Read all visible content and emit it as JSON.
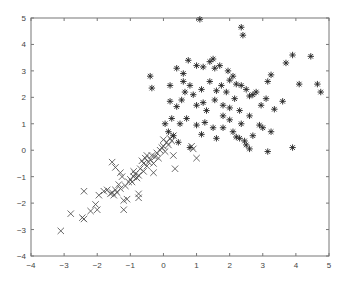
{
  "chart_data": {
    "type": "scatter",
    "title": "",
    "xlabel": "",
    "ylabel": "",
    "xlim": [
      -4,
      5
    ],
    "ylim": [
      -4,
      5
    ],
    "grid": false,
    "legend": null,
    "x_ticks": [
      -4,
      -3,
      -2,
      -1,
      0,
      1,
      2,
      3,
      4,
      5
    ],
    "y_ticks": [
      -4,
      -3,
      -2,
      -1,
      0,
      1,
      2,
      3,
      4,
      5
    ],
    "series": [
      {
        "name": "class-x",
        "marker": "x",
        "points": [
          [
            -3.1,
            -3.05
          ],
          [
            -2.8,
            -2.4
          ],
          [
            -2.45,
            -2.55
          ],
          [
            -2.4,
            -2.6
          ],
          [
            -2.4,
            -1.55
          ],
          [
            -2.2,
            -2.3
          ],
          [
            -2.05,
            -2.05
          ],
          [
            -2.0,
            -2.25
          ],
          [
            -1.95,
            -1.7
          ],
          [
            -1.8,
            -1.55
          ],
          [
            -1.7,
            -1.5
          ],
          [
            -1.6,
            -1.65
          ],
          [
            -1.55,
            -1.6
          ],
          [
            -1.5,
            -1.7
          ],
          [
            -1.45,
            -1.5
          ],
          [
            -1.4,
            -1.6
          ],
          [
            -1.35,
            -1.3
          ],
          [
            -1.3,
            -1.45
          ],
          [
            -1.25,
            -1.0
          ],
          [
            -1.2,
            -1.9
          ],
          [
            -1.2,
            -2.25
          ],
          [
            -1.15,
            -1.35
          ],
          [
            -1.1,
            -1.85
          ],
          [
            -1.05,
            -1.2
          ],
          [
            -1.0,
            -1.1
          ],
          [
            -0.95,
            -1.2
          ],
          [
            -0.9,
            -1.0
          ],
          [
            -0.85,
            -0.9
          ],
          [
            -0.8,
            -1.05
          ],
          [
            -0.75,
            -0.95
          ],
          [
            -0.75,
            -1.65
          ],
          [
            -0.75,
            -1.8
          ],
          [
            -0.7,
            -0.7
          ],
          [
            -0.65,
            -0.4
          ],
          [
            -0.6,
            -0.8
          ],
          [
            -0.6,
            -0.5
          ],
          [
            -0.55,
            -0.3
          ],
          [
            -0.5,
            -0.6
          ],
          [
            -0.45,
            -0.45
          ],
          [
            -0.4,
            -0.35
          ],
          [
            -0.35,
            -0.2
          ],
          [
            -0.3,
            -0.5
          ],
          [
            -0.3,
            -0.85
          ],
          [
            -0.25,
            -0.25
          ],
          [
            -0.2,
            -0.1
          ],
          [
            -0.15,
            -0.3
          ],
          [
            -0.1,
            0.0
          ],
          [
            -0.05,
            0.1
          ],
          [
            0.0,
            0.15
          ],
          [
            0.05,
            -0.05
          ],
          [
            0.1,
            0.3
          ],
          [
            0.15,
            0.2
          ],
          [
            0.2,
            0.45
          ],
          [
            0.25,
            0.35
          ],
          [
            0.3,
            0.55
          ],
          [
            0.35,
            -0.7
          ],
          [
            0.85,
            0.15
          ],
          [
            0.9,
            0.05
          ],
          [
            1.0,
            -0.3
          ],
          [
            -1.55,
            -0.45
          ],
          [
            -1.45,
            -0.65
          ],
          [
            -1.3,
            -0.85
          ],
          [
            -0.9,
            -0.8
          ],
          [
            -0.5,
            -0.2
          ],
          [
            0.0,
            0.4
          ],
          [
            0.3,
            -0.2
          ]
        ]
      },
      {
        "name": "class-star",
        "marker": "*",
        "points": [
          [
            1.1,
            4.95
          ],
          [
            2.35,
            4.65
          ],
          [
            2.4,
            4.35
          ],
          [
            -0.4,
            2.8
          ],
          [
            -0.35,
            2.35
          ],
          [
            0.2,
            2.45
          ],
          [
            0.4,
            3.1
          ],
          [
            0.6,
            2.9
          ],
          [
            0.75,
            3.4
          ],
          [
            1.0,
            3.2
          ],
          [
            1.2,
            3.15
          ],
          [
            1.4,
            3.35
          ],
          [
            1.5,
            3.45
          ],
          [
            1.55,
            3.1
          ],
          [
            1.7,
            3.2
          ],
          [
            1.95,
            3.0
          ],
          [
            0.6,
            2.6
          ],
          [
            0.8,
            2.45
          ],
          [
            1.15,
            2.3
          ],
          [
            1.4,
            2.6
          ],
          [
            1.6,
            2.25
          ],
          [
            1.75,
            2.45
          ],
          [
            2.0,
            2.65
          ],
          [
            2.1,
            2.8
          ],
          [
            2.2,
            2.5
          ],
          [
            2.35,
            2.45
          ],
          [
            2.5,
            2.3
          ],
          [
            0.2,
            1.85
          ],
          [
            0.4,
            1.65
          ],
          [
            0.55,
            1.9
          ],
          [
            0.9,
            2.1
          ],
          [
            1.0,
            1.7
          ],
          [
            1.2,
            1.8
          ],
          [
            1.3,
            1.5
          ],
          [
            1.55,
            1.9
          ],
          [
            1.8,
            1.7
          ],
          [
            2.0,
            1.6
          ],
          [
            2.15,
            1.95
          ],
          [
            2.3,
            1.5
          ],
          [
            2.6,
            2.05
          ],
          [
            0.25,
            1.2
          ],
          [
            0.5,
            1.0
          ],
          [
            0.7,
            1.2
          ],
          [
            1.0,
            0.95
          ],
          [
            1.25,
            1.05
          ],
          [
            1.5,
            0.85
          ],
          [
            1.8,
            0.85
          ],
          [
            2.1,
            0.7
          ],
          [
            2.2,
            0.5
          ],
          [
            2.3,
            0.45
          ],
          [
            2.45,
            0.35
          ],
          [
            2.5,
            0.2
          ],
          [
            2.6,
            0.05
          ],
          [
            2.7,
            0.55
          ],
          [
            2.9,
            0.95
          ],
          [
            3.0,
            0.85
          ],
          [
            3.25,
            2.85
          ],
          [
            3.6,
            1.85
          ],
          [
            3.35,
            1.55
          ],
          [
            3.25,
            0.7
          ],
          [
            3.15,
            -0.05
          ],
          [
            3.9,
            0.1
          ],
          [
            3.7,
            3.3
          ],
          [
            3.9,
            3.6
          ],
          [
            4.1,
            2.5
          ],
          [
            4.45,
            3.55
          ],
          [
            4.65,
            2.5
          ],
          [
            4.75,
            2.2
          ],
          [
            3.15,
            2.6
          ],
          [
            3.1,
            1.95
          ],
          [
            2.7,
            2.1
          ],
          [
            2.8,
            2.2
          ],
          [
            0.3,
            0.55
          ],
          [
            0.45,
            0.3
          ],
          [
            0.8,
            0.1
          ],
          [
            0.05,
            1.0
          ],
          [
            0.15,
            0.7
          ],
          [
            1.15,
            0.6
          ],
          [
            1.6,
            0.45
          ],
          [
            2.0,
            1.15
          ],
          [
            2.35,
            1.0
          ],
          [
            2.6,
            1.3
          ],
          [
            1.8,
            1.3
          ],
          [
            0.65,
            2.2
          ],
          [
            1.9,
            2.2
          ],
          [
            2.95,
            1.7
          ]
        ]
      }
    ]
  }
}
